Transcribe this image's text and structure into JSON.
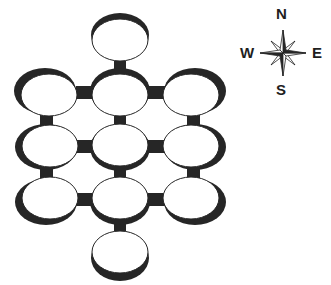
{
  "diagram": {
    "ink_color": "#262626",
    "background": "#ffffff",
    "rings": [
      {
        "id": "n",
        "cx": 120,
        "cy": 37,
        "shade": "top"
      },
      {
        "id": "r1c1",
        "cx": 47,
        "cy": 93,
        "shade": "top-left"
      },
      {
        "id": "r1c2",
        "cx": 120,
        "cy": 93,
        "shade": "top"
      },
      {
        "id": "r1c3",
        "cx": 193,
        "cy": 93,
        "shade": "top-right"
      },
      {
        "id": "r2c1",
        "cx": 47,
        "cy": 147,
        "shade": "left"
      },
      {
        "id": "r2c2",
        "cx": 120,
        "cy": 147,
        "shade": "bottom"
      },
      {
        "id": "r2c3",
        "cx": 193,
        "cy": 147,
        "shade": "right"
      },
      {
        "id": "r3c1",
        "cx": 47,
        "cy": 200,
        "shade": "bottom-left"
      },
      {
        "id": "r3c2",
        "cx": 120,
        "cy": 200,
        "shade": "bottom"
      },
      {
        "id": "r3c3",
        "cx": 193,
        "cy": 200,
        "shade": "bottom-right"
      },
      {
        "id": "s",
        "cx": 120,
        "cy": 255,
        "shade": "bottom"
      }
    ]
  },
  "compass": {
    "north": "N",
    "south": "S",
    "east": "E",
    "west": "W"
  }
}
